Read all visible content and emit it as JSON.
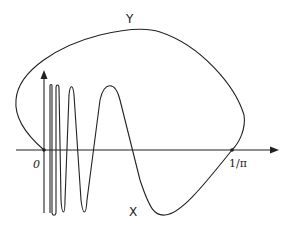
{
  "diagram": {
    "labels": {
      "origin": "0",
      "endpoint": "1/π",
      "top_arc": "Y",
      "bottom_curve": "X"
    },
    "colors": {
      "stroke": "#222222",
      "background": "#ffffff"
    },
    "axes": {
      "origin": [
        44,
        150
      ],
      "x_axis": {
        "from": 16,
        "to": 278
      },
      "y_axis": {
        "from": 213,
        "to": 71
      }
    },
    "points": [
      {
        "name": "origin-point",
        "at": [
          44,
          150
        ]
      },
      {
        "name": "one-over-pi-point",
        "at": [
          232,
          150
        ]
      }
    ]
  }
}
